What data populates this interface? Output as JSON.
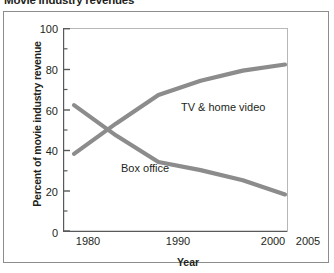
{
  "title": "Movie industry revenues",
  "chart_data": {
    "type": "line",
    "title": "Movie industry revenues",
    "xlabel": "Year",
    "ylabel": "Percent of movie industry revenue",
    "xlim": [
      1980,
      2005
    ],
    "ylim": [
      0,
      100
    ],
    "grid": false,
    "legend_position": "inline-labels",
    "x_tick_labels": [
      "1980",
      "1990",
      "2000",
      "2005"
    ],
    "x_ticks": [
      1980,
      1990,
      2000,
      2005
    ],
    "y_ticks": [
      0,
      20,
      40,
      60,
      80,
      100
    ],
    "y_tick_labels": [
      "0",
      "20",
      "40",
      "60",
      "80",
      "100"
    ],
    "y_minor_ticks": [
      10,
      30,
      50,
      70,
      90
    ],
    "x": [
      1980,
      1985,
      1990,
      1995,
      2000,
      2005
    ],
    "series": [
      {
        "name": "TV & home video",
        "color": "#8c8c8c",
        "values": [
          38,
          53,
          67,
          74,
          79,
          82
        ]
      },
      {
        "name": "Box office",
        "color": "#8c8c8c",
        "values": [
          62,
          47,
          34,
          30,
          25,
          18
        ]
      }
    ],
    "annotations": [
      {
        "text": "TV & home video",
        "x_px": 183,
        "y_px": 102
      },
      {
        "text": "Box office",
        "x_px": 122,
        "y_px": 163
      }
    ]
  },
  "colors": {
    "line": "#8c8c8c",
    "axis": "#58595b",
    "frame": "#8d8d8d",
    "text": "#231f20",
    "plot_background": "#ffffff"
  }
}
